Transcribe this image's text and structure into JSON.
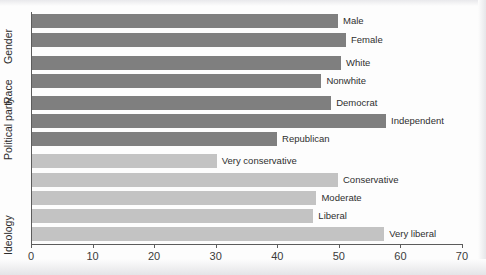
{
  "figure": {
    "title_sliver": "",
    "axis_color": "#5c5c5c",
    "bar_color_dark": "#7f7f7f",
    "bar_color_light": "#c3c3c3"
  },
  "axis": {
    "x_ticks": [
      "0",
      "10",
      "20",
      "30",
      "40",
      "50",
      "60",
      "70"
    ]
  },
  "groups": [
    {
      "label": "Gender"
    },
    {
      "label": "Race"
    },
    {
      "label": "Political party"
    },
    {
      "label": "Ideology"
    }
  ],
  "chart_data": {
    "type": "bar",
    "orientation": "horizontal",
    "title": "",
    "xlabel": "",
    "ylabel": "",
    "xlim": [
      0,
      70
    ],
    "xticks": [
      0,
      10,
      20,
      30,
      40,
      50,
      60,
      70
    ],
    "grid": false,
    "legend": "none",
    "categories": [
      "Male",
      "Female",
      "White",
      "Nonwhite",
      "Democrat",
      "Independent",
      "Republican",
      "Very conservative",
      "Conservative",
      "Moderate",
      "Liberal",
      "Very liberal"
    ],
    "values": [
      49.7,
      51.0,
      50.2,
      47.0,
      48.6,
      57.5,
      39.8,
      30.0,
      49.7,
      46.2,
      45.7,
      57.2
    ],
    "group_of": [
      "Gender",
      "Gender",
      "Race",
      "Race",
      "Political party",
      "Political party",
      "Political party",
      "Ideology",
      "Ideology",
      "Ideology",
      "Ideology",
      "Ideology"
    ],
    "series": [
      {
        "name": "percent",
        "values": [
          49.7,
          51.0,
          50.2,
          47.0,
          48.6,
          57.5,
          39.8,
          30.0,
          49.7,
          46.2,
          45.7,
          57.2
        ]
      }
    ]
  },
  "bars": [
    {
      "label": "Male",
      "value": 49.7,
      "shade": "dark",
      "top": 14
    },
    {
      "label": "Female",
      "value": 51.0,
      "shade": "dark",
      "top": 33
    },
    {
      "label": "White",
      "value": 50.2,
      "shade": "dark",
      "top": 56
    },
    {
      "label": "Nonwhite",
      "value": 47.0,
      "shade": "dark",
      "top": 74
    },
    {
      "label": "Democrat",
      "value": 48.6,
      "shade": "dark",
      "top": 96
    },
    {
      "label": "Independent",
      "value": 57.5,
      "shade": "dark",
      "top": 114
    },
    {
      "label": "Republican",
      "value": 39.8,
      "shade": "dark",
      "top": 132
    },
    {
      "label": "Very conservative",
      "value": 30.0,
      "shade": "light",
      "top": 154
    },
    {
      "label": "Conservative",
      "value": 49.7,
      "shade": "light",
      "top": 173
    },
    {
      "label": "Moderate",
      "value": 46.2,
      "shade": "light",
      "top": 191
    },
    {
      "label": "Liberal",
      "value": 45.7,
      "shade": "light",
      "top": 209
    },
    {
      "label": "Very liberal",
      "value": 57.2,
      "shade": "light",
      "top": 227
    }
  ]
}
